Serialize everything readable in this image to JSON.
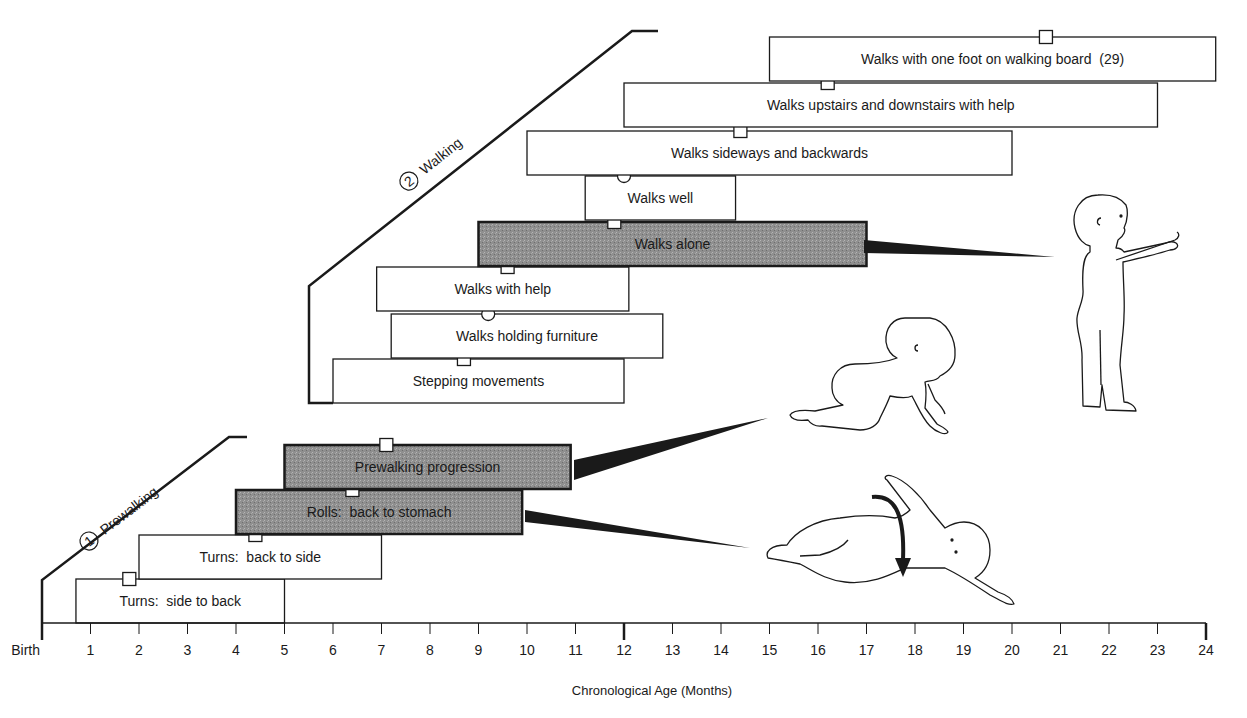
{
  "chart_data": {
    "type": "table",
    "subtype": "range-bar (Gantt-style developmental milestone chart)",
    "title": "",
    "xlabel": "Chronological Age (Months)",
    "ylabel": "",
    "x_range": [
      0,
      24
    ],
    "x_ticks": [
      "Birth",
      "1",
      "2",
      "3",
      "4",
      "5",
      "6",
      "7",
      "8",
      "9",
      "10",
      "11",
      "12",
      "13",
      "14",
      "15",
      "16",
      "17",
      "18",
      "19",
      "20",
      "21",
      "22",
      "23",
      "24"
    ],
    "grid": false,
    "legend": null,
    "phases": [
      {
        "number": "1",
        "label": "Prewalking"
      },
      {
        "number": "2",
        "label": "Walking"
      }
    ],
    "milestones": [
      {
        "phase": "Prewalking",
        "label": "Turns:  side to back",
        "start": 0.7,
        "end": 5.0,
        "marker": 1.8,
        "marker_shape": "square",
        "shaded": false
      },
      {
        "phase": "Prewalking",
        "label": "Turns:  back to side",
        "start": 2.0,
        "end": 7.0,
        "marker": 4.4,
        "marker_shape": "square",
        "shaded": false
      },
      {
        "phase": "Prewalking",
        "label": "Rolls:  back to stomach",
        "start": 4.0,
        "end": 9.9,
        "marker": 6.4,
        "marker_shape": "square",
        "shaded": true
      },
      {
        "phase": "Prewalking",
        "label": "Prewalking progression",
        "start": 5.0,
        "end": 10.9,
        "marker": 7.1,
        "marker_shape": "square",
        "shaded": true
      },
      {
        "phase": "Walking",
        "label": "Stepping movements",
        "start": 6.0,
        "end": 12.0,
        "marker": 8.7,
        "marker_shape": "square",
        "shaded": false
      },
      {
        "phase": "Walking",
        "label": "Walks holding furniture",
        "start": 7.2,
        "end": 12.8,
        "marker": 9.2,
        "marker_shape": "circle",
        "shaded": false
      },
      {
        "phase": "Walking",
        "label": "Walks with help",
        "start": 6.9,
        "end": 12.1,
        "marker": 9.6,
        "marker_shape": "square",
        "shaded": false
      },
      {
        "phase": "Walking",
        "label": "Walks alone",
        "start": 9.0,
        "end": 17.0,
        "marker": 11.8,
        "marker_shape": "square",
        "shaded": true
      },
      {
        "phase": "Walking",
        "label": "Walks well",
        "start": 11.2,
        "end": 14.3,
        "marker": 12.0,
        "marker_shape": "circle",
        "shaded": false
      },
      {
        "phase": "Walking",
        "label": "Walks sideways and backwards",
        "start": 10.0,
        "end": 20.0,
        "marker": 14.4,
        "marker_shape": "square",
        "shaded": false
      },
      {
        "phase": "Walking",
        "label": "Walks upstairs and downstairs with help",
        "start": 12.0,
        "end": 23.0,
        "marker": 16.2,
        "marker_shape": "square",
        "shaded": false
      },
      {
        "phase": "Walking",
        "label": "Walks with one foot on walking board  (29)",
        "start": 15.0,
        "end": 24.2,
        "marker": 20.7,
        "marker_shape": "square",
        "shaded": false
      }
    ],
    "illustrations": [
      {
        "depicts": "infant rolling from back to stomach (with curved arrow)",
        "linked_to": "Rolls:  back to stomach"
      },
      {
        "depicts": "infant crawling on hands and knees",
        "linked_to": "Prewalking progression"
      },
      {
        "depicts": "toddler standing with arms forward",
        "linked_to": "Walks alone"
      }
    ]
  },
  "colors": {
    "line": "#1a1a1a",
    "bar_fill": "#ffffff",
    "shaded_fill": "#8a8a8a",
    "background": "#ffffff"
  },
  "layout": {
    "axis_y": 623,
    "x0": 42,
    "px_per_month": 48.5,
    "bar_height": 44,
    "rows": [
      {
        "label_index": 0,
        "top": 579
      },
      {
        "label_index": 1,
        "top": 535
      },
      {
        "label_index": 2,
        "top": 490
      },
      {
        "label_index": 3,
        "top": 445
      },
      {
        "label_index": 4,
        "top": 359
      },
      {
        "label_index": 5,
        "top": 314
      },
      {
        "label_index": 6,
        "top": 267
      },
      {
        "label_index": 7,
        "top": 222
      },
      {
        "label_index": 8,
        "top": 176
      },
      {
        "label_index": 9,
        "top": 131
      },
      {
        "label_index": 10,
        "top": 83
      },
      {
        "label_index": 11,
        "top": 37
      }
    ]
  }
}
